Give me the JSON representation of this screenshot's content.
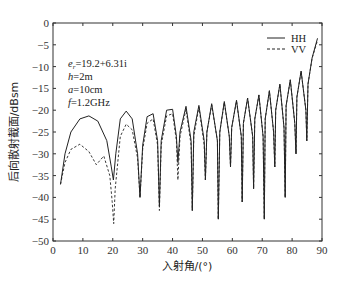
{
  "chart_data": {
    "type": "line",
    "title": "",
    "xlabel": "入射角/(°)",
    "ylabel": "后向散射截面/dBsm",
    "xlim": [
      0,
      90
    ],
    "ylim": [
      -50,
      0
    ],
    "xticks": [
      0,
      10,
      20,
      30,
      40,
      50,
      60,
      70,
      80,
      90
    ],
    "yticks": [
      0,
      -5,
      -10,
      -15,
      -20,
      -25,
      -30,
      -35,
      -40,
      -45,
      -50
    ],
    "grid": false,
    "legend_position": "upper right",
    "annotations": [
      "e_r=19.2+6.31i",
      "h=2m",
      "a=10cm",
      "f=1.2GHz"
    ],
    "series": [
      {
        "name": "HH",
        "style": "solid",
        "x": [
          2.5,
          4,
          6,
          9,
          12,
          15,
          18,
          19.5,
          20.2,
          21,
          22.5,
          24.5,
          26.5,
          28.3,
          29.1,
          30,
          31.5,
          33.5,
          35.0,
          35.6,
          36.2,
          38,
          40,
          41.3,
          41.8,
          42.5,
          44.5,
          46.2,
          46.6,
          47.1,
          48.8,
          50.6,
          51.0,
          51.5,
          53.1,
          55.0,
          55.3,
          55.8,
          57.3,
          59.0,
          59.4,
          59.8,
          61.4,
          63.0,
          63.3,
          63.7,
          65.1,
          66.8,
          67.1,
          67.5,
          68.9,
          70.3,
          70.7,
          71.0,
          72.4,
          73.8,
          74.2,
          74.5,
          75.9,
          77.3,
          77.7,
          78.0,
          79.4,
          80.9,
          81.3,
          81.6,
          83.0,
          84.6,
          84.9,
          85.3,
          86.7,
          88.5
        ],
        "values": [
          -37,
          -30,
          -25,
          -22,
          -21.3,
          -22.5,
          -27,
          -33,
          -36,
          -30,
          -22,
          -20.2,
          -22,
          -30,
          -40,
          -28,
          -21.5,
          -20.8,
          -27,
          -42,
          -27,
          -20,
          -19.8,
          -26,
          -32,
          -25,
          -19.1,
          -27,
          -43,
          -25,
          -18.9,
          -27,
          -36,
          -25,
          -18.5,
          -27,
          -45,
          -25,
          -18,
          -26,
          -33,
          -24,
          -17.7,
          -26,
          -41,
          -23,
          -17.2,
          -26,
          -38,
          -22,
          -16.5,
          -26,
          -45,
          -22,
          -15.5,
          -25,
          -33,
          -20,
          -14,
          -24,
          -40,
          -19,
          -13,
          -23,
          -30,
          -17,
          -11,
          -20,
          -27,
          -14,
          -8,
          -3.5
        ]
      },
      {
        "name": "VV",
        "style": "dashed",
        "x": [
          2.5,
          4,
          6,
          9,
          12,
          14.5,
          17,
          19,
          19.8,
          20.3,
          20.8,
          22.5,
          24.5,
          26.5,
          28.3,
          29.1,
          30,
          31.5,
          33.5,
          35.0,
          35.6,
          36.2,
          38,
          40,
          41.3,
          41.8,
          42.5,
          44.5,
          46.2,
          46.6,
          47.1,
          48.8,
          50.6,
          51.0,
          51.5,
          53.1,
          55.0,
          55.3,
          55.8,
          57.3,
          59.0,
          59.4,
          59.8,
          61.4,
          63.0,
          63.3,
          63.7,
          65.1,
          66.8,
          67.1,
          67.5,
          68.9,
          70.3,
          70.7,
          71.0,
          72.4,
          73.8,
          74.2,
          74.5,
          75.9,
          77.3,
          77.7,
          78.0,
          79.4,
          80.9,
          81.3,
          81.6,
          83.0,
          84.6,
          84.9,
          85.3,
          86.7,
          88.5
        ],
        "values": [
          -37,
          -32,
          -29,
          -27.8,
          -29.5,
          -32.5,
          -30.5,
          -35,
          -41,
          -46,
          -38,
          -26,
          -23.2,
          -24.5,
          -31,
          -40,
          -29,
          -23,
          -22,
          -28,
          -43,
          -28,
          -21.3,
          -20.8,
          -27,
          -36,
          -26,
          -19.8,
          -28,
          -43,
          -26,
          -19.3,
          -28,
          -36,
          -25,
          -18.8,
          -27,
          -45,
          -25,
          -18.2,
          -26,
          -33,
          -24,
          -17.9,
          -26,
          -41,
          -23,
          -17.3,
          -26,
          -38,
          -22,
          -16.6,
          -26,
          -45,
          -22,
          -15.6,
          -25,
          -33,
          -20,
          -14.1,
          -24,
          -40,
          -19,
          -13.1,
          -23,
          -30,
          -17,
          -11.1,
          -20,
          -27,
          -14,
          -8.1,
          -4
        ]
      }
    ]
  },
  "legend": {
    "items": [
      {
        "label": "HH"
      },
      {
        "label": "VV"
      }
    ]
  },
  "annotation": {
    "er_prefix": "e",
    "er_sub": "r",
    "er_value": "=19.2+6.31i",
    "h": "h",
    "h_value": "=2m",
    "a": "a",
    "a_value": "=10cm",
    "f": "f",
    "f_value": "=1.2GHz"
  },
  "axes": {
    "xlabel": "入射角/(°)",
    "ylabel": "后向散射截面/dBsm"
  }
}
